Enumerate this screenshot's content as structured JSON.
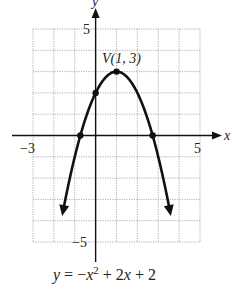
{
  "chart_data": {
    "type": "line",
    "title": "",
    "equation": "y = -x^2 + 2x + 2",
    "xlabel": "x",
    "ylabel": "y",
    "xlim": [
      -3,
      5
    ],
    "ylim": [
      -5,
      5
    ],
    "grid": true,
    "x_ticks_labeled": [
      -3,
      5
    ],
    "y_ticks_labeled": [
      5,
      -5
    ],
    "series": [
      {
        "name": "y = -x^2 + 2x + 2",
        "x": [
          -1.6,
          -1.0,
          -0.5,
          -0.732,
          0,
          0.5,
          1,
          1.5,
          2,
          2.5,
          2.732,
          3,
          3.6
        ],
        "values": [
          -5.76,
          -1,
          0.75,
          0,
          2,
          2.75,
          3,
          2.75,
          2,
          0.75,
          0,
          -1,
          -5.76
        ]
      }
    ],
    "marked_points": [
      {
        "label": "V(1, 3)",
        "x": 1,
        "y": 3
      },
      {
        "label": "",
        "x": 0,
        "y": 2
      },
      {
        "label": "",
        "x": -0.732,
        "y": 0
      },
      {
        "label": "",
        "x": 2.732,
        "y": 0
      }
    ],
    "annotations": [
      "V(1, 3)",
      "y = −x² + 2x + 2"
    ]
  },
  "labels": {
    "x_axis": "x",
    "y_axis": "y",
    "x_min": "−3",
    "x_max": "5",
    "y_max": "5",
    "y_min": "−5",
    "vertex": "V(1, 3)",
    "eq_y": "y",
    "eq_mid": " = −",
    "eq_x": "x",
    "eq_exp": "2",
    "eq_rest_a": " + 2",
    "eq_x2": "x",
    "eq_rest_b": " + 2"
  }
}
